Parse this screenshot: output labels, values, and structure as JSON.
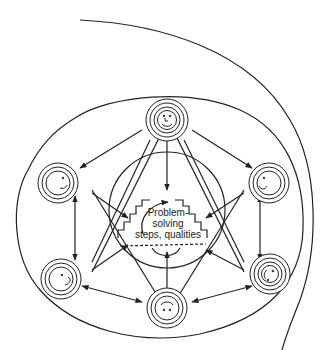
{
  "diagram": {
    "center_label": {
      "line1": "Problem-",
      "line2": "solving",
      "line3": "steps, qualities"
    },
    "nodes": [
      {
        "id": "top",
        "expression": "smiling face"
      },
      {
        "id": "upper-left",
        "expression": "profile face"
      },
      {
        "id": "upper-right",
        "expression": "profile face"
      },
      {
        "id": "lower-left",
        "expression": "profile face"
      },
      {
        "id": "lower-right",
        "expression": "profile face"
      },
      {
        "id": "bottom",
        "expression": "frowning face"
      }
    ],
    "colors": {
      "stroke": "#222222",
      "background": "#ffffff"
    }
  }
}
